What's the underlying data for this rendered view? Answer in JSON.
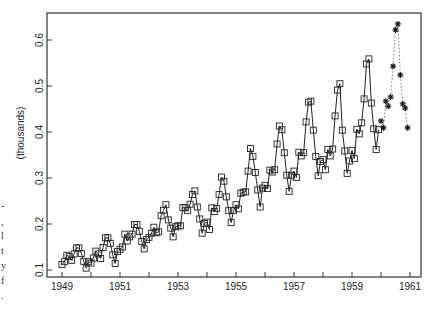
{
  "chart_data": {
    "type": "line",
    "title": "",
    "xlabel": "",
    "ylabel": "(thousands)",
    "xlim": [
      1948.55,
      1961.35
    ],
    "ylim": [
      0.085,
      0.655
    ],
    "grid": false,
    "legend": null,
    "x_ticks": [
      1949,
      1950,
      1951,
      1952,
      1953,
      1954,
      1955,
      1956,
      1957,
      1958,
      1959,
      1960,
      1961
    ],
    "x_tick_labels": [
      "1949",
      "",
      "1951",
      "",
      "1953",
      "",
      "1955",
      "",
      "1957",
      "",
      "1959",
      "",
      "1961"
    ],
    "y_ticks": [
      0.1,
      0.2,
      0.3,
      0.4,
      0.5,
      0.6
    ],
    "y_tick_labels": [
      "0.1",
      "0.2",
      "0.3",
      "0.4",
      "0.5",
      "0.6"
    ],
    "series": [
      {
        "name": "observed",
        "marker": "square",
        "line": "solid",
        "x_start": 1949.0,
        "x_step": 0.08333,
        "values": [
          0.112,
          0.118,
          0.132,
          0.129,
          0.121,
          0.135,
          0.148,
          0.148,
          0.136,
          0.119,
          0.104,
          0.118,
          0.115,
          0.126,
          0.141,
          0.135,
          0.125,
          0.149,
          0.17,
          0.17,
          0.158,
          0.133,
          0.114,
          0.14,
          0.145,
          0.15,
          0.178,
          0.163,
          0.172,
          0.178,
          0.199,
          0.199,
          0.184,
          0.162,
          0.146,
          0.166,
          0.171,
          0.18,
          0.193,
          0.181,
          0.183,
          0.218,
          0.23,
          0.242,
          0.209,
          0.191,
          0.172,
          0.194,
          0.196,
          0.196,
          0.236,
          0.235,
          0.229,
          0.243,
          0.264,
          0.272,
          0.237,
          0.211,
          0.18,
          0.201,
          0.204,
          0.188,
          0.235,
          0.227,
          0.234,
          0.264,
          0.302,
          0.293,
          0.259,
          0.229,
          0.203,
          0.229,
          0.242,
          0.233,
          0.267,
          0.269,
          0.27,
          0.315,
          0.364,
          0.347,
          0.312,
          0.274,
          0.237,
          0.278,
          0.284,
          0.277,
          0.317,
          0.313,
          0.318,
          0.374,
          0.413,
          0.405,
          0.355,
          0.306,
          0.271,
          0.306,
          0.315,
          0.301,
          0.356,
          0.348,
          0.355,
          0.422,
          0.465,
          0.467,
          0.404,
          0.347,
          0.305,
          0.336,
          0.34,
          0.318,
          0.362,
          0.348,
          0.363,
          0.435,
          0.491,
          0.505,
          0.404,
          0.359,
          0.31,
          0.337,
          0.36,
          0.342,
          0.406,
          0.396,
          0.42,
          0.472,
          0.548,
          0.559,
          0.463,
          0.407,
          0.362,
          0.405
        ]
      },
      {
        "name": "forecast",
        "marker": "asterisk",
        "line": "dotted",
        "x_start": 1960.0,
        "x_step": 0.08333,
        "values": [
          0.424,
          0.409,
          0.467,
          0.456,
          0.476,
          0.543,
          0.622,
          0.635,
          0.524,
          0.461,
          0.452,
          0.409
        ]
      }
    ]
  },
  "left_fragments": [
    "-",
    ",",
    "l",
    "t",
    "y",
    "f",
    "."
  ],
  "colors": {
    "line": "#222222",
    "frame": "#333333",
    "background": "#ffffff"
  }
}
